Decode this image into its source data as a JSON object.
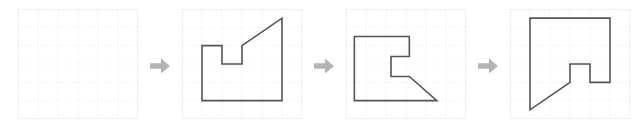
{
  "figure": {
    "type": "shape-transformation-sequence",
    "panel_count": 4,
    "arrow_count": 3,
    "background_color": "#ffffff",
    "grid": {
      "columns": 6,
      "rows": 6,
      "cell_width": 20,
      "cell_height": 18.333,
      "width": 120,
      "height": 110,
      "line_color": "#e8e8ec",
      "border_color": "#d8d8dd",
      "style": "dotted"
    },
    "shape_style": {
      "stroke_color": "#555555",
      "stroke_width": 1.6,
      "fill": "none"
    },
    "arrow": {
      "icon_name": "right-arrow-icon",
      "label": "transforms to",
      "color": "#b4b4b4",
      "direction": "right"
    }
  },
  "panels": [
    {
      "index": 1,
      "name": "empty-grid-panel",
      "label": "Empty grid",
      "has_shape": false,
      "points": ""
    },
    {
      "index": 2,
      "name": "shape-panel-original",
      "label": "Original shape",
      "has_shape": true,
      "rotation_degrees": 0,
      "points": "20,91.667 20,36.667 40,36.667 40,55 60,55 60,36.667 100,9.167 100,91.667"
    },
    {
      "index": 3,
      "name": "shape-panel-rotated-90",
      "label": "Rotated 90 degrees counter-clockwise",
      "has_shape": true,
      "rotation_degrees": 90,
      "points": "8.333,91.667 8.333,27.5 63.333,27.5 63.333,47.5 45,47.5 45,67.5 63.333,67.5 90.833,91.667"
    },
    {
      "index": 4,
      "name": "shape-panel-rotated-180",
      "label": "Rotated 180 degrees",
      "has_shape": true,
      "rotation_degrees": 180,
      "points": "20,9.167 100,9.167 100,73.333 80,73.333 80,55 60,55 60,73.333 20,100.833"
    }
  ],
  "arrows": [
    {
      "index": 1,
      "name": "transform-arrow-1",
      "label": "→"
    },
    {
      "index": 2,
      "name": "transform-arrow-2",
      "label": "→"
    },
    {
      "index": 3,
      "name": "transform-arrow-3",
      "label": "→"
    }
  ]
}
